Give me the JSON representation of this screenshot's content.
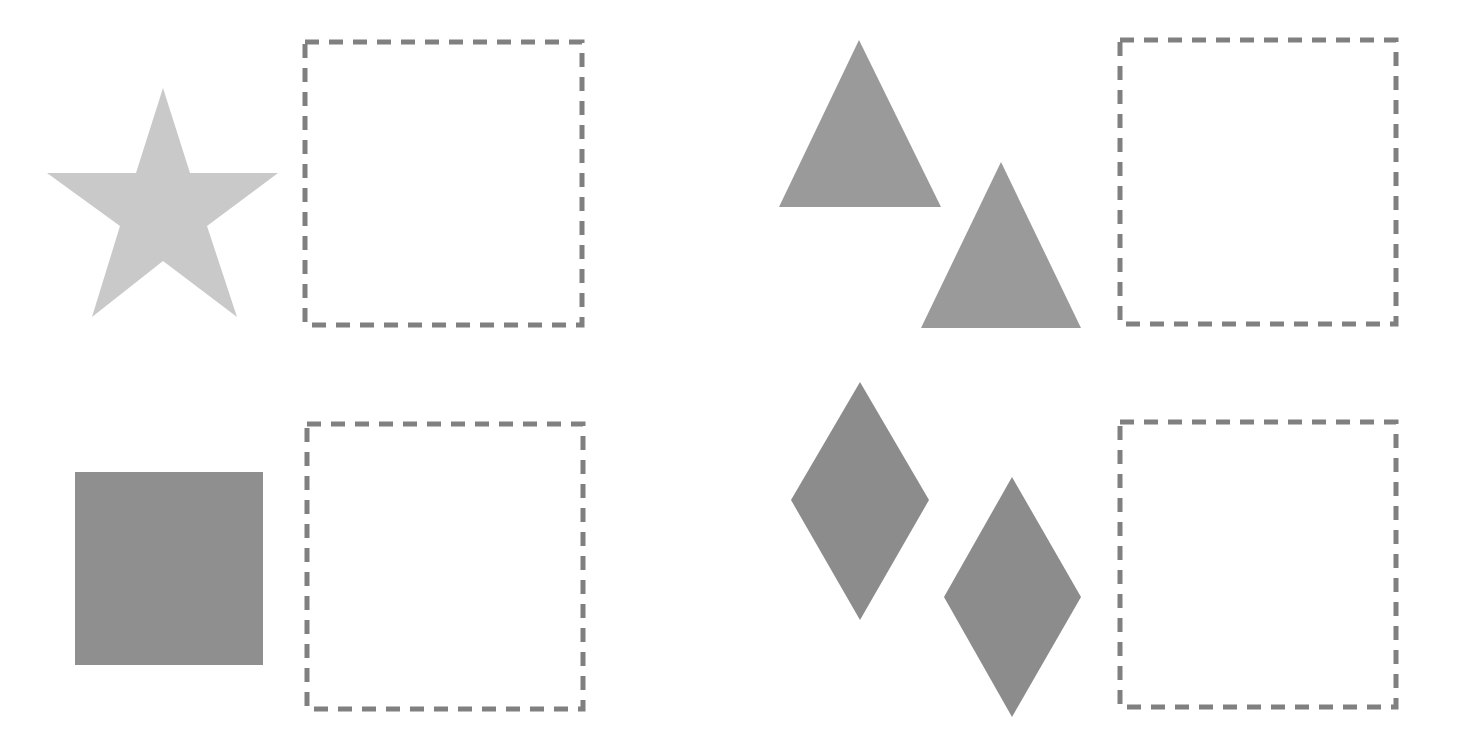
{
  "canvas": {
    "width": 1464,
    "height": 741,
    "background": "#ffffff"
  },
  "colors": {
    "star": "#c9c9c9",
    "square": "#8f8f8f",
    "triangle": "#9a9a9a",
    "diamond": "#8c8c8c",
    "dropzone_border": "#808080"
  },
  "groups": [
    {
      "id": "star-group",
      "shape": "star",
      "count": 1,
      "shapes": [
        {
          "type": "star",
          "points": "163,88 190,173 278,173 207,226 237,317 163,261 92,317 120,226 47,173 136,173"
        }
      ],
      "dropzone": {
        "x": 305,
        "y": 42,
        "w": 277,
        "h": 283
      }
    },
    {
      "id": "triangle-group",
      "shape": "triangle",
      "count": 2,
      "shapes": [
        {
          "type": "triangle",
          "points": "859,40 941,207 779,207"
        },
        {
          "type": "triangle",
          "points": "1001,162 1081,328 921,328"
        }
      ],
      "dropzone": {
        "x": 1120,
        "y": 40,
        "w": 276,
        "h": 284
      }
    },
    {
      "id": "square-group",
      "shape": "square",
      "count": 1,
      "shapes": [
        {
          "type": "rect",
          "x": 75,
          "y": 472,
          "w": 188,
          "h": 193
        }
      ],
      "dropzone": {
        "x": 307,
        "y": 424,
        "w": 276,
        "h": 285
      }
    },
    {
      "id": "diamond-group",
      "shape": "diamond",
      "count": 2,
      "shapes": [
        {
          "type": "diamond",
          "points": "860,382 929,500 860,620 791,500"
        },
        {
          "type": "diamond",
          "points": "1012,477 1081,597 1012,717 944,597"
        }
      ],
      "dropzone": {
        "x": 1120,
        "y": 422,
        "w": 276,
        "h": 285
      }
    }
  ]
}
